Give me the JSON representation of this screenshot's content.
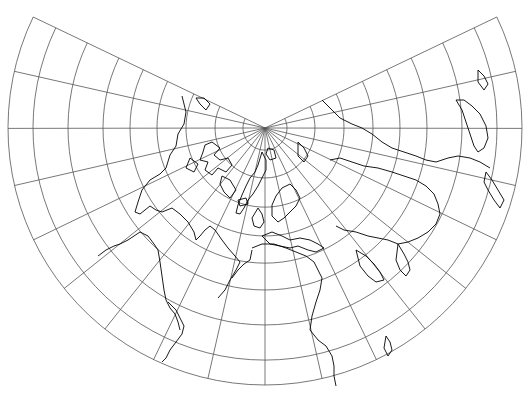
{
  "map": {
    "title": "Lambert conformal conic projection (North Pole centered)",
    "projection": "lambert-conformal-conic",
    "colors": {
      "background": "#ffffff",
      "graticule": "#555555",
      "coastline": "#000000"
    },
    "pole": {
      "x": 265,
      "y": 128
    },
    "cone_half_angle_deg": 115.6,
    "meridian_count_each_side": 9,
    "parallel_radii_px": [
      22,
      50,
      79,
      108,
      135,
      162,
      197,
      232,
      257
    ]
  }
}
